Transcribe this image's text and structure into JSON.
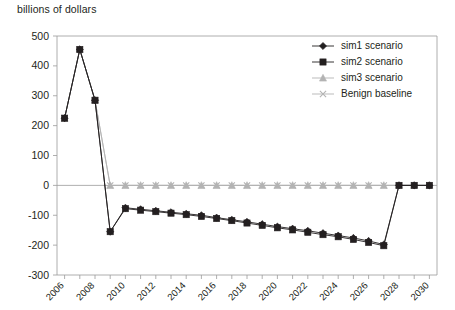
{
  "chart_data": {
    "type": "line",
    "title": "billions of dollars",
    "xlabel": "",
    "ylabel": "billions of dollars",
    "x": [
      2006,
      2007,
      2008,
      2009,
      2010,
      2011,
      2012,
      2013,
      2014,
      2015,
      2016,
      2017,
      2018,
      2019,
      2020,
      2021,
      2022,
      2023,
      2024,
      2025,
      2026,
      2027,
      2028,
      2029,
      2030
    ],
    "xlim": [
      2005.5,
      2030.5
    ],
    "ylim": [
      -300,
      500
    ],
    "ytick_values": [
      -300,
      -200,
      -100,
      0,
      100,
      200,
      300,
      400,
      500
    ],
    "ytick_labels": [
      "-300",
      "-200",
      "-100",
      "0",
      "100",
      "200",
      "300",
      "400",
      "500"
    ],
    "xtick_labels": [
      "2006",
      "2008",
      "2010",
      "2012",
      "2014",
      "2016",
      "2018",
      "2020",
      "2022",
      "2024",
      "2026",
      "2028",
      "2030"
    ],
    "xtick_values": [
      2006,
      2008,
      2010,
      2012,
      2014,
      2016,
      2018,
      2020,
      2022,
      2024,
      2026,
      2028,
      2030
    ],
    "grid": false,
    "legend_position": "top-right",
    "series": [
      {
        "name": "sim1 scenario",
        "marker": "diamond",
        "color": "#231f20",
        "values": [
          225,
          455,
          285,
          -155,
          -75,
          -80,
          -85,
          -90,
          -95,
          -100,
          -108,
          -115,
          -122,
          -130,
          -138,
          -145,
          -152,
          -160,
          -168,
          -176,
          -186,
          -198,
          0,
          0,
          0
        ]
      },
      {
        "name": "sim2 scenario",
        "marker": "square",
        "color": "#231f20",
        "values": [
          225,
          455,
          285,
          -155,
          -78,
          -83,
          -88,
          -93,
          -98,
          -104,
          -111,
          -118,
          -126,
          -134,
          -142,
          -149,
          -157,
          -165,
          -172,
          -181,
          -191,
          -202,
          0,
          0,
          0
        ]
      },
      {
        "name": "sim3 scenario",
        "marker": "triangle",
        "color": "#b3b3b3",
        "values": [
          225,
          455,
          285,
          0,
          0,
          0,
          0,
          0,
          0,
          0,
          0,
          0,
          0,
          0,
          0,
          0,
          0,
          0,
          0,
          0,
          0,
          0,
          0,
          0,
          0
        ]
      },
      {
        "name": "Benign baseline",
        "marker": "cross",
        "color": "#b3b3b3",
        "values": [
          225,
          455,
          285,
          0,
          0,
          0,
          0,
          0,
          0,
          0,
          0,
          0,
          0,
          0,
          0,
          0,
          0,
          0,
          0,
          0,
          0,
          0,
          0,
          0,
          0
        ]
      }
    ]
  },
  "colors": {
    "axis": "#9a9a9a",
    "text": "#231f20",
    "dark_series": "#231f20",
    "light_series": "#b3b3b3",
    "background": "#ffffff"
  }
}
